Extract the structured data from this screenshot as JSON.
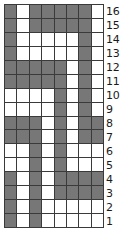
{
  "chart_data": {
    "type": "heatmap",
    "title": "",
    "xlabel": "",
    "ylabel": "",
    "columns": 8,
    "rows": 16,
    "legend": [],
    "grid": true,
    "colors": {
      "filled": "#777777",
      "empty": "#ffffff",
      "gridline": "#3a3a3a",
      "label": "#1a1a1a"
    },
    "row_labels": [
      "16",
      "15",
      "14",
      "13",
      "12",
      "11",
      "10",
      "9",
      "8",
      "7",
      "6",
      "5",
      "4",
      "3",
      "2",
      "1"
    ],
    "values": [
      [
        1,
        0,
        1,
        1,
        1,
        1,
        1,
        0
      ],
      [
        1,
        0,
        1,
        1,
        1,
        1,
        1,
        0
      ],
      [
        1,
        0,
        0,
        0,
        0,
        0,
        1,
        0
      ],
      [
        1,
        0,
        0,
        0,
        0,
        0,
        1,
        0
      ],
      [
        1,
        1,
        1,
        1,
        1,
        0,
        1,
        0
      ],
      [
        1,
        1,
        1,
        1,
        1,
        0,
        1,
        0
      ],
      [
        0,
        0,
        0,
        0,
        1,
        0,
        1,
        0
      ],
      [
        0,
        0,
        0,
        0,
        1,
        0,
        1,
        0
      ],
      [
        1,
        1,
        1,
        0,
        1,
        0,
        1,
        1
      ],
      [
        1,
        1,
        1,
        0,
        1,
        0,
        1,
        1
      ],
      [
        0,
        0,
        1,
        0,
        1,
        0,
        0,
        0
      ],
      [
        0,
        0,
        1,
        0,
        1,
        0,
        0,
        0
      ],
      [
        1,
        0,
        1,
        0,
        1,
        1,
        1,
        1
      ],
      [
        1,
        0,
        1,
        0,
        1,
        1,
        1,
        1
      ],
      [
        1,
        0,
        1,
        0,
        0,
        0,
        0,
        0
      ],
      [
        1,
        0,
        1,
        0,
        0,
        0,
        0,
        0
      ]
    ]
  }
}
